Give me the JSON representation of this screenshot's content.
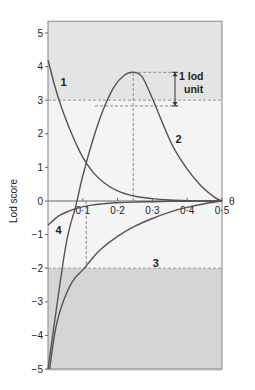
{
  "chart_data": {
    "type": "line",
    "title": "",
    "xlabel": "θ",
    "ylabel": "Lod score",
    "xlim": [
      0,
      0.5
    ],
    "ylim": [
      -5,
      5.35
    ],
    "x_ticks": [
      0.1,
      0.2,
      0.3,
      0.4,
      0.5
    ],
    "x_tick_labels": [
      "0·1",
      "0·2",
      "0·3",
      "0·4",
      "0·5"
    ],
    "y_ticks": [
      5,
      4,
      3,
      2,
      1,
      0,
      -1,
      -2,
      -3,
      -4,
      -5
    ],
    "y_tick_labels": [
      "5",
      "4",
      "3",
      "2",
      "1",
      "0",
      "−1",
      "−2",
      "−3",
      "−4",
      "−5"
    ],
    "grid": false,
    "regions": [
      {
        "name": "significant-linkage",
        "from": 3,
        "to": 5.35,
        "color": "#e4e4e4"
      },
      {
        "name": "inconclusive",
        "from": -2,
        "to": 3,
        "color": "#f4f4f4"
      },
      {
        "name": "linkage-excluded",
        "from": -5.05,
        "to": -2,
        "color": "#d5d5d5"
      }
    ],
    "thresholds": [
      3,
      -2
    ],
    "series": [
      {
        "name": "1",
        "label_pos": [
          0.045,
          3.55
        ],
        "x": [
          0.0,
          0.02,
          0.04,
          0.06,
          0.08,
          0.1,
          0.13,
          0.16,
          0.2,
          0.25,
          0.3,
          0.35,
          0.4,
          0.45,
          0.5
        ],
        "values": [
          4.2,
          3.4,
          2.75,
          2.2,
          1.72,
          1.3,
          0.85,
          0.55,
          0.3,
          0.14,
          0.07,
          0.03,
          0.01,
          0.0,
          0.0
        ]
      },
      {
        "name": "2",
        "label_pos": [
          0.375,
          1.85
        ],
        "x": [
          0.0,
          0.05,
          0.08,
          0.1,
          0.13,
          0.16,
          0.19,
          0.22,
          0.245,
          0.27,
          0.3,
          0.33,
          0.36,
          0.4,
          0.44,
          0.48,
          0.5
        ],
        "values": [
          -5.0,
          -1.4,
          -0.15,
          0.75,
          1.85,
          2.75,
          3.4,
          3.75,
          3.83,
          3.7,
          3.05,
          2.3,
          1.6,
          0.95,
          0.45,
          0.1,
          0.0
        ]
      },
      {
        "name": "3",
        "label_pos": [
          0.31,
          -1.85
        ],
        "x": [
          0.005,
          0.02,
          0.04,
          0.07,
          0.1,
          0.12,
          0.15,
          0.2,
          0.25,
          0.3,
          0.35,
          0.4,
          0.45,
          0.5
        ],
        "values": [
          -5.0,
          -3.9,
          -3.1,
          -2.4,
          -2.05,
          -1.8,
          -1.45,
          -1.05,
          -0.75,
          -0.52,
          -0.33,
          -0.19,
          -0.08,
          0.0
        ]
      },
      {
        "name": "4",
        "label_pos": [
          0.03,
          -0.85
        ],
        "x": [
          0.0,
          0.03,
          0.06,
          0.09,
          0.12,
          0.16,
          0.2,
          0.25,
          0.3,
          0.35,
          0.4,
          0.45,
          0.5
        ],
        "values": [
          -0.72,
          -0.45,
          -0.3,
          -0.2,
          -0.13,
          -0.08,
          -0.05,
          -0.03,
          -0.02,
          -0.01,
          -0.005,
          0.0,
          0.0
        ]
      }
    ],
    "annotations": [
      {
        "type": "dashed-vertical",
        "x": 0.245,
        "from": 0,
        "to": 3.83
      },
      {
        "type": "dashed-horizontal",
        "y": 3.83,
        "from_x": 0.245,
        "to_x": 0.37
      },
      {
        "type": "dashed-horizontal",
        "y": 2.83,
        "from_x": 0.135,
        "to_x": 0.38
      },
      {
        "type": "dashed-vertical",
        "x": 0.11,
        "from": 0,
        "to": -2
      },
      {
        "type": "double-arrow",
        "x": 0.365,
        "from": 3.83,
        "to": 2.83
      },
      {
        "type": "text",
        "text": "1 lod",
        "x": 0.375,
        "y": 3.55
      },
      {
        "type": "text",
        "text": "unit",
        "x": 0.395,
        "y": 3.15
      }
    ]
  },
  "labels": {
    "ylabel": "Lod score",
    "xlabel": "θ",
    "ann_line1": "1 lod",
    "ann_line2": "unit"
  }
}
